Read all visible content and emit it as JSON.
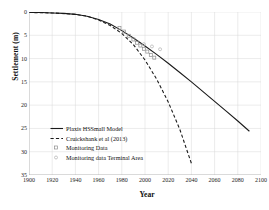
{
  "chart_data": {
    "type": "line",
    "title": "",
    "xlabel": "Year",
    "ylabel": "Settlement (m)",
    "xlim": [
      1900,
      2100
    ],
    "ylim": [
      0,
      35
    ],
    "y_inverted": true,
    "grid": true,
    "legend_position": "lower-left-inside",
    "xticks": [
      1900,
      1920,
      1940,
      1960,
      1980,
      2000,
      2020,
      2040,
      2060,
      2080,
      2100
    ],
    "yticks": [
      0,
      5,
      10,
      15,
      20,
      25,
      30,
      35
    ],
    "xtick_labels": [
      "1900",
      "1920",
      "1940",
      "1960",
      "1980",
      "2000",
      "2020",
      "2040",
      "2060",
      "2080",
      "2100"
    ],
    "ytick_labels": [
      "0",
      "5",
      "10",
      "15",
      "20",
      "25",
      "30",
      "35"
    ],
    "series": [
      {
        "name": "Plaxis HSSmall Model",
        "style": "solid",
        "color": "#1a1a1a",
        "x": [
          1900,
          1910,
          1920,
          1930,
          1940,
          1950,
          1960,
          1970,
          1980,
          1990,
          2000,
          2010,
          2020,
          2030,
          2040,
          2050,
          2060,
          2070,
          2080,
          2090
        ],
        "y": [
          0.1,
          0.1,
          0.2,
          0.3,
          0.5,
          0.9,
          1.6,
          2.6,
          4.0,
          5.6,
          7.3,
          9.1,
          11.0,
          13.0,
          15.0,
          17.1,
          19.2,
          21.3,
          23.4,
          25.6
        ]
      },
      {
        "name": "Cruickshank et al (2013)",
        "style": "dashed",
        "color": "#1a1a1a",
        "x": [
          1900,
          1920,
          1940,
          1950,
          1960,
          1970,
          1980,
          1990,
          2000,
          2010,
          2020,
          2030,
          2040
        ],
        "y": [
          0.1,
          0.2,
          0.5,
          0.9,
          1.7,
          2.9,
          4.6,
          7.0,
          10.3,
          14.4,
          19.3,
          25.2,
          32.5
        ]
      },
      {
        "name": "Monitoring Data",
        "style": "scatter-square",
        "color": "#8c8c8c",
        "x": [
          1978,
          1982,
          1986,
          1990,
          1993,
          1996,
          1999,
          2002,
          2005,
          2008
        ],
        "y": [
          3.4,
          4.2,
          5.1,
          5.9,
          6.6,
          7.2,
          7.9,
          8.5,
          9.2,
          9.8
        ]
      },
      {
        "name": "Monitoring data Terminal Area",
        "style": "scatter-circle",
        "color": "#b0b0b0",
        "x": [
          1999,
          2006,
          2013
        ],
        "y": [
          6.9,
          7.4,
          8.0
        ]
      }
    ]
  },
  "legend": {
    "items": [
      {
        "label": "Plaxis HSSmall Model",
        "key": "solid-line-key"
      },
      {
        "label": "Cruickshank et al (2013)",
        "key": "dashed-line-key"
      },
      {
        "label": "Monitoring Data",
        "key": "square-marker-key"
      },
      {
        "label": "Monitoring data Terminal Area",
        "key": "circle-marker-key"
      }
    ]
  }
}
